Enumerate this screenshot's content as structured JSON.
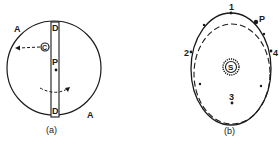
{
  "figure_a": {
    "caption": "(a)",
    "labels": {
      "a_top": "A",
      "a_bottom": "A",
      "d_top": "D",
      "d_bottom": "D",
      "c": "C",
      "p": "P"
    }
  },
  "figure_b": {
    "caption": "(b)",
    "labels": {
      "pos1": "1",
      "pos2": "2",
      "pos3": "3",
      "pos4": "4",
      "p": "P",
      "sun": "S"
    }
  },
  "colors": {
    "ink": "#1a1a1a",
    "background": "#ffffff"
  }
}
